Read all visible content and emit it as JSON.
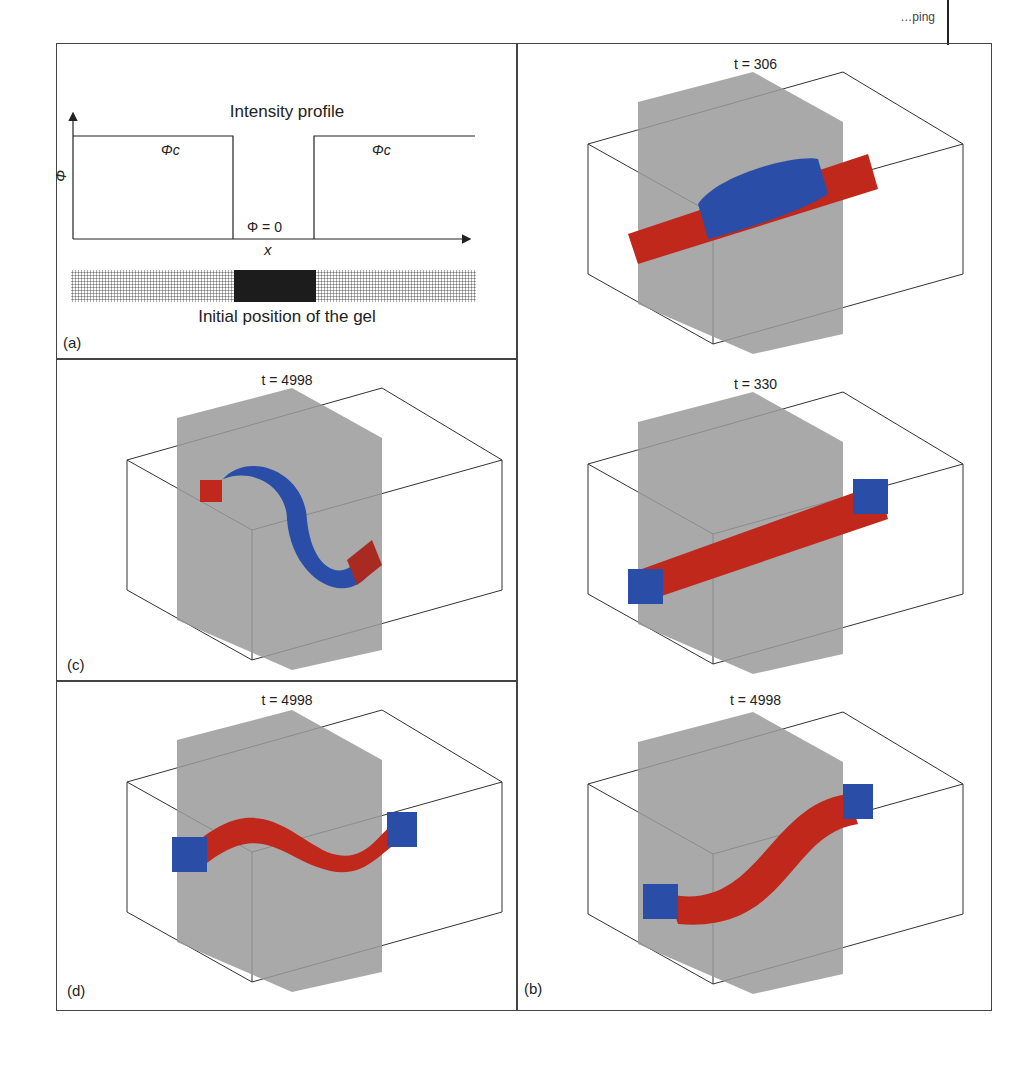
{
  "header": {
    "text": "…ping"
  },
  "panels": {
    "a": {
      "label": "(a)",
      "title": "Intensity profile",
      "y_axis_label": "Φ",
      "x_axis_label": "x",
      "left_region_label": "Φc",
      "right_region_label": "Φc",
      "center_label": "Φ = 0",
      "gel_caption": "Initial position of the gel"
    },
    "b_top": {
      "title": "t = 306"
    },
    "b_mid": {
      "title": "t = 330"
    },
    "b_bot": {
      "title": "t = 4998",
      "label": "(b)"
    },
    "c": {
      "title": "t = 4998",
      "label": "(c)"
    },
    "d": {
      "title": "t = 4998",
      "label": "(d)"
    }
  },
  "axes": {
    "z_label": "z",
    "y_label": "y",
    "x_label": "x",
    "z_ticks": [
      "40",
      "20",
      "0",
      "−20"
    ],
    "y_ticks": [
      "40",
      "20",
      "0",
      "−20"
    ],
    "x_ticks": [
      "50",
      "100",
      "150",
      "200"
    ]
  },
  "colors": {
    "red": "#c0281c",
    "blue": "#2a4ea8",
    "green": "#3fae4a",
    "yellow": "#e6d23a",
    "plane": "#9a9a9a"
  }
}
